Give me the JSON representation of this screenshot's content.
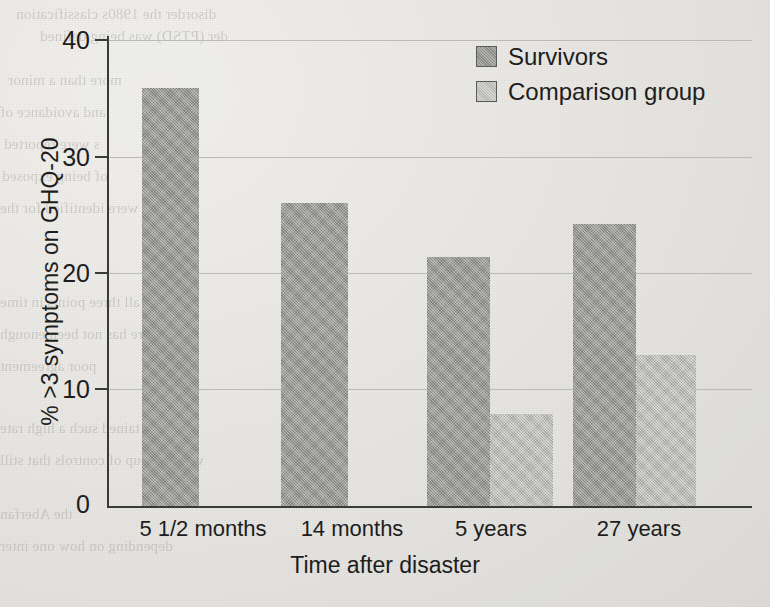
{
  "chart_data": {
    "type": "bar",
    "title": "",
    "xlabel": "Time after disaster",
    "ylabel": "% >3 symptoms on GHQ-20",
    "categories": [
      "5 1/2 months",
      "14 months",
      "5 years",
      "27 years"
    ],
    "series": [
      {
        "name": "Survivors",
        "color": "#9a9a98",
        "values": [
          35.9,
          26.0,
          21.4,
          24.2
        ]
      },
      {
        "name": "Comparison group",
        "color": "#c2c2bf",
        "values": [
          null,
          null,
          7.9,
          13.0
        ]
      }
    ],
    "ylim": [
      0,
      40
    ],
    "yticks": [
      0,
      10,
      20,
      30,
      40
    ],
    "ytick_labels": [
      "0",
      "10",
      "20",
      "30",
      "40"
    ],
    "grid": true,
    "legend_position": "top-right"
  },
  "legend": {
    "items": [
      {
        "label": "Survivors",
        "swatch": "survivors"
      },
      {
        "label": "Comparison group",
        "swatch": "comparison"
      }
    ]
  },
  "axes": {
    "y_title": "% >3 symptoms on GHQ-20",
    "x_title": "Time after disaster",
    "y_labels": [
      "40",
      "30",
      "20",
      "10",
      "0"
    ],
    "x_labels": [
      "5 1/2 months",
      "14 months",
      "5 years",
      "27 years"
    ]
  },
  "page_bleed_text": [
    "disorder the 1980s classification",
    "der (PTSD) was being defined",
    "more than a minor",
    "and avoidance of",
    "s were reported",
    "of being exposed",
    "SD were identified for the",
    "sed at all three points in time",
    "re has not been enough",
    "poor agreement",
    "tained such a high rate",
    "with a group of controls that still",
    "the Aberfan",
    "depending on how one inter"
  ],
  "colors": {
    "survivors": "#9a9a98",
    "comparison": "#c2c2bf",
    "axis": "#3a3a38",
    "grid": "#b4b4b0",
    "paper": "#eceae6",
    "text": "#1d1d1b"
  }
}
